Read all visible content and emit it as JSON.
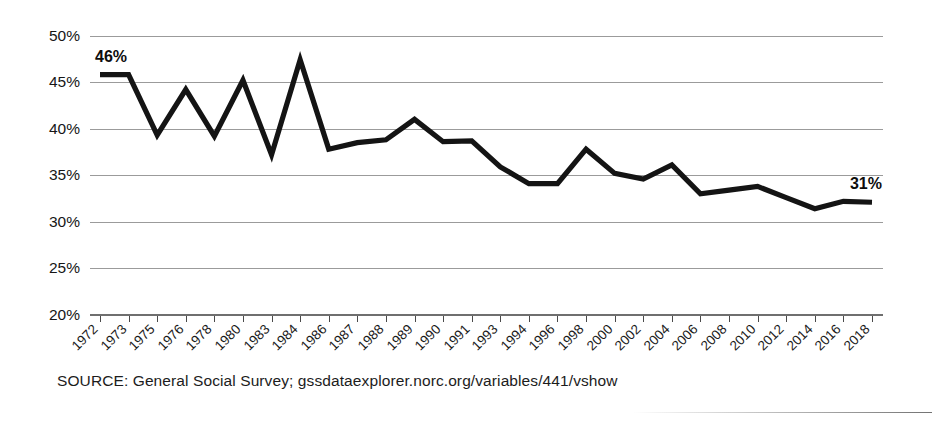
{
  "chart_data": {
    "type": "line",
    "title": "",
    "subtitle": "",
    "xlabel": "",
    "ylabel": "",
    "ylim": [
      20,
      50
    ],
    "ytick_step": 5,
    "grid": true,
    "legend": null,
    "y_tick_labels": [
      "50%",
      "45%",
      "40%",
      "35%",
      "30%",
      "25%",
      "20%"
    ],
    "y_tick_values": [
      50,
      45,
      40,
      35,
      30,
      25,
      20
    ],
    "categories": [
      "1972",
      "1973",
      "1975",
      "1976",
      "1978",
      "1980",
      "1983",
      "1984",
      "1986",
      "1987",
      "1988",
      "1989",
      "1990",
      "1991",
      "1993",
      "1994",
      "1996",
      "1998",
      "2000",
      "2002",
      "2004",
      "2006",
      "2008",
      "2010",
      "2012",
      "2014",
      "2016",
      "2018"
    ],
    "values": [
      45.8,
      45.8,
      39.3,
      44.2,
      39.2,
      45.2,
      37.2,
      47.4,
      37.8,
      38.5,
      38.8,
      41.0,
      38.6,
      38.7,
      35.9,
      34.1,
      34.1,
      37.8,
      35.2,
      34.6,
      36.1,
      33.0,
      33.4,
      33.8,
      32.6,
      31.4,
      32.2,
      32.1
    ],
    "annotations": [
      {
        "name": "start-value",
        "text": "46%",
        "category": "1972",
        "value": 45.8
      },
      {
        "name": "end-value",
        "text": "31%",
        "category": "2018",
        "value": 32.1
      }
    ],
    "series_color": "#141414",
    "grid_color": "#9b9b9b"
  },
  "footer": {
    "source": "SOURCE: General Social Survey; gssdataexplorer.norc.org/variables/441/vshow"
  }
}
